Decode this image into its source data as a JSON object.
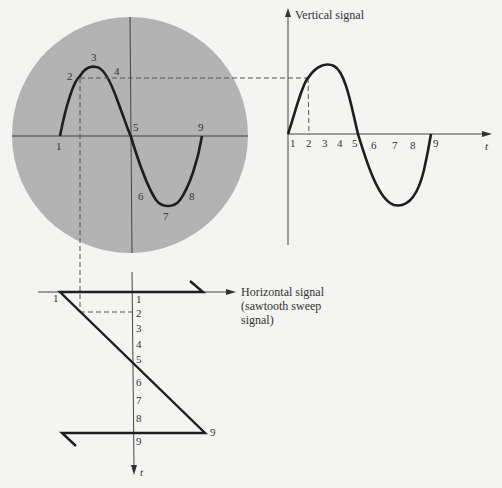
{
  "figure": {
    "screen": {
      "point_labels": [
        "1",
        "2",
        "3",
        "4",
        "5",
        "6",
        "7",
        "8",
        "9"
      ],
      "fill_color": "#b3b3b3"
    },
    "vertical_plot": {
      "title": "Vertical signal",
      "x_axis_label": "t",
      "tick_labels": [
        "1",
        "2",
        "3",
        "4",
        "5",
        "6",
        "7",
        "8",
        "9"
      ]
    },
    "horizontal_plot": {
      "title_line1": "Horizontal signal",
      "title_line2": "(sawtooth sweep",
      "title_line3": "signal)",
      "time_axis_label": "t",
      "tick_labels": [
        "1",
        "2",
        "3",
        "4",
        "5",
        "6",
        "7",
        "8",
        "9"
      ],
      "start_label": "1",
      "end_label": "9"
    },
    "colors": {
      "background": "#f4f4f2",
      "trace": "#1e1e1e",
      "axis": "#444444",
      "dashed": "#555555"
    }
  }
}
